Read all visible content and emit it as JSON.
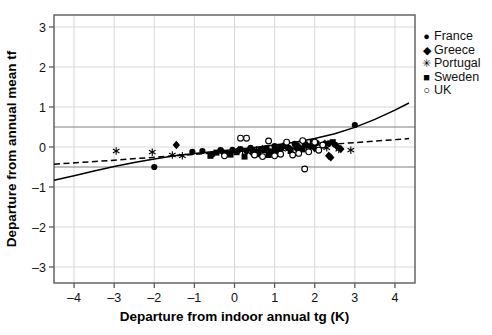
{
  "chart_data": {
    "type": "scatter",
    "title": "",
    "xlabel": "Departure from indoor annual tg (K)",
    "ylabel": "Departure from annual mean tf",
    "xlim": [
      -4.5,
      4.5
    ],
    "ylim": [
      -3.4,
      3.3
    ],
    "xticks": [
      -4,
      -3,
      -2,
      -1,
      0,
      1,
      2,
      3,
      4
    ],
    "xticklabels": [
      "–4",
      "–3",
      "–2",
      "–1",
      "0",
      "1",
      "2",
      "3",
      "4"
    ],
    "yticks": [
      -3,
      -2,
      -1,
      0,
      1,
      2,
      3
    ],
    "yticklabels": [
      "–3",
      "–2",
      "–1",
      "0",
      "1",
      "2",
      "3"
    ],
    "grid": true,
    "grid_color": "#d8d8d8",
    "frame_color": "#5a5a5a",
    "legend_position": "outside-right-top",
    "reference_lines": [
      {
        "name": "upper-comfort-band",
        "y": 0.5,
        "style": "solid",
        "color": "#808080"
      },
      {
        "name": "lower-comfort-band",
        "y": -0.5,
        "style": "solid",
        "color": "#808080"
      }
    ],
    "fit_curves": [
      {
        "name": "solid-fit-curve",
        "style": "solid",
        "color": "#000000",
        "points": [
          [
            -4.5,
            -0.83
          ],
          [
            -4.0,
            -0.72
          ],
          [
            -3.5,
            -0.6
          ],
          [
            -3.0,
            -0.49
          ],
          [
            -2.5,
            -0.39
          ],
          [
            -2.0,
            -0.3
          ],
          [
            -1.5,
            -0.22
          ],
          [
            -1.0,
            -0.16
          ],
          [
            -0.5,
            -0.11
          ],
          [
            0.0,
            -0.06
          ],
          [
            0.5,
            -0.01
          ],
          [
            1.0,
            0.05
          ],
          [
            1.5,
            0.12
          ],
          [
            2.0,
            0.21
          ],
          [
            2.5,
            0.33
          ],
          [
            3.0,
            0.49
          ],
          [
            3.5,
            0.69
          ],
          [
            4.0,
            0.92
          ],
          [
            4.35,
            1.1
          ]
        ]
      },
      {
        "name": "dashed-fit-line",
        "style": "dashed",
        "color": "#000000",
        "points": [
          [
            -4.5,
            -0.43
          ],
          [
            -3.0,
            -0.33
          ],
          [
            -1.5,
            -0.22
          ],
          [
            0.0,
            -0.11
          ],
          [
            1.5,
            0.0
          ],
          [
            3.0,
            0.11
          ],
          [
            4.35,
            0.21
          ]
        ]
      }
    ],
    "series": [
      {
        "name": "France",
        "marker": "filled-circle",
        "glyph": "●",
        "color": "#000000",
        "points": [
          [
            -2.0,
            -0.5
          ],
          [
            -1.05,
            -0.12
          ],
          [
            -0.8,
            -0.1
          ],
          [
            -0.55,
            -0.18
          ],
          [
            -0.35,
            -0.08
          ],
          [
            -0.2,
            -0.15
          ],
          [
            -0.05,
            -0.07
          ],
          [
            0.05,
            -0.12
          ],
          [
            0.15,
            -0.05
          ],
          [
            0.3,
            -0.1
          ],
          [
            0.4,
            -0.02
          ],
          [
            0.55,
            -0.14
          ],
          [
            0.65,
            -0.06
          ],
          [
            0.8,
            -0.03
          ],
          [
            0.9,
            -0.11
          ],
          [
            1.0,
            0.02
          ],
          [
            1.1,
            -0.06
          ],
          [
            1.25,
            0.05
          ],
          [
            1.35,
            -0.02
          ],
          [
            1.5,
            0.08
          ],
          [
            1.6,
            0.0
          ],
          [
            1.75,
            0.06
          ],
          [
            1.9,
            0.02
          ],
          [
            2.05,
            0.1
          ],
          [
            2.2,
            0.04
          ],
          [
            2.35,
            0.09
          ],
          [
            2.5,
            0.06
          ],
          [
            3.0,
            0.55
          ]
        ]
      },
      {
        "name": "Greece",
        "marker": "filled-diamond",
        "glyph": "◆",
        "color": "#000000",
        "points": [
          [
            -1.45,
            0.05
          ],
          [
            -0.3,
            -0.12
          ],
          [
            0.1,
            -0.08
          ],
          [
            0.45,
            -0.16
          ],
          [
            0.7,
            -0.05
          ],
          [
            1.05,
            -0.09
          ],
          [
            1.3,
            0.0
          ],
          [
            1.55,
            -0.04
          ],
          [
            1.8,
            0.05
          ],
          [
            2.0,
            -0.03
          ],
          [
            2.25,
            0.08
          ],
          [
            2.35,
            -0.22
          ],
          [
            2.4,
            -0.26
          ],
          [
            2.55,
            0.02
          ],
          [
            2.65,
            -0.05
          ]
        ]
      },
      {
        "name": "Portugal",
        "marker": "star",
        "glyph": "✳",
        "color": "#000000",
        "points": [
          [
            -2.95,
            -0.1
          ],
          [
            -2.05,
            -0.13
          ],
          [
            -1.55,
            -0.2
          ],
          [
            -1.3,
            -0.22
          ],
          [
            0.2,
            -0.09
          ],
          [
            0.55,
            -0.07
          ],
          [
            0.95,
            -0.11
          ],
          [
            1.2,
            -0.06
          ],
          [
            2.3,
            -0.02
          ],
          [
            2.6,
            -0.06
          ],
          [
            2.9,
            -0.08
          ]
        ]
      },
      {
        "name": "Sweden",
        "marker": "filled-square",
        "glyph": "■",
        "color": "#000000",
        "points": [
          [
            -0.6,
            -0.22
          ],
          [
            -0.45,
            -0.14
          ],
          [
            -0.1,
            -0.19
          ],
          [
            0.05,
            -0.13
          ],
          [
            0.25,
            -0.24
          ],
          [
            0.45,
            -0.1
          ],
          [
            0.6,
            -0.18
          ],
          [
            0.75,
            -0.08
          ],
          [
            0.85,
            -0.2
          ],
          [
            1.0,
            -0.12
          ],
          [
            1.15,
            -0.02
          ],
          [
            1.4,
            -0.1
          ],
          [
            1.55,
            0.04
          ],
          [
            1.7,
            -0.06
          ],
          [
            1.95,
            0.12
          ],
          [
            2.45,
            0.12
          ]
        ]
      },
      {
        "name": "UK",
        "marker": "open-circle",
        "glyph": "○",
        "color": "#000000",
        "points": [
          [
            -0.25,
            -0.22
          ],
          [
            0.15,
            0.22
          ],
          [
            0.3,
            0.22
          ],
          [
            0.5,
            -0.2
          ],
          [
            0.7,
            -0.24
          ],
          [
            0.85,
            0.15
          ],
          [
            1.0,
            -0.22
          ],
          [
            1.15,
            -0.18
          ],
          [
            1.3,
            0.12
          ],
          [
            1.45,
            -0.2
          ],
          [
            1.6,
            -0.16
          ],
          [
            1.7,
            0.16
          ],
          [
            1.85,
            -0.12
          ],
          [
            2.0,
            0.12
          ],
          [
            2.1,
            -0.08
          ],
          [
            2.2,
            0.05
          ],
          [
            1.75,
            -0.55
          ]
        ]
      }
    ]
  },
  "legend": {
    "items": [
      {
        "label": "France",
        "glyph": "●"
      },
      {
        "label": "Greece",
        "glyph": "◆"
      },
      {
        "label": "Portugal",
        "glyph": "✳"
      },
      {
        "label": "Sweden",
        "glyph": "■"
      },
      {
        "label": "UK",
        "glyph": "○"
      }
    ]
  }
}
